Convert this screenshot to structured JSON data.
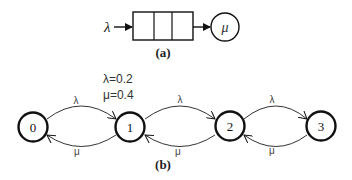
{
  "figure_a": {
    "arrival_label": "λ",
    "service_label": "μ",
    "queue_slots": 3,
    "caption": "(a)"
  },
  "figure_b": {
    "params": {
      "lambda_text": "λ=0.2",
      "mu_text": "μ=0.4"
    },
    "states": [
      "0",
      "1",
      "2",
      "3"
    ],
    "forward_label": "λ",
    "backward_label": "μ",
    "caption": "(b)"
  },
  "colors": {
    "stroke": "#111111",
    "text": "#222222",
    "param_text": "#333333",
    "background": "#ffffff"
  }
}
